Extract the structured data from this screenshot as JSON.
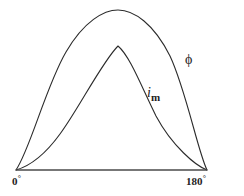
{
  "figure": {
    "background_color": "#ffffff",
    "line_color": "#2b2b2b",
    "baseline_color": "#4a4a4a"
  },
  "axis": {
    "start_label": "0",
    "end_label": "180",
    "degree_symbol": "°"
  },
  "annotations": {
    "flux_symbol": "ϕ",
    "current_symbol": "i",
    "current_subscript": "m"
  },
  "chart_data": {
    "type": "line",
    "title": "",
    "xlabel": "",
    "ylabel": "",
    "xlim": [
      0,
      180
    ],
    "ylim": [
      0,
      1
    ],
    "grid": false,
    "legend": "inline-annotations",
    "x_tick_labels": [
      "0°",
      "180°"
    ],
    "x_ticks": [
      0,
      180
    ],
    "x": [
      0,
      9,
      18,
      27,
      36,
      45,
      54,
      63,
      72,
      81,
      90,
      99,
      108,
      117,
      126,
      135,
      144,
      153,
      162,
      171,
      180
    ],
    "series": [
      {
        "name": "ϕ",
        "label": "ϕ",
        "description": "magnetic flux, smooth sinusoidal half-wave peaking near 95 degrees",
        "values": [
          0.0,
          0.155,
          0.305,
          0.445,
          0.575,
          0.69,
          0.79,
          0.875,
          0.94,
          0.985,
          1.0,
          0.985,
          0.94,
          0.875,
          0.79,
          0.69,
          0.575,
          0.445,
          0.305,
          0.155,
          0.0
        ],
        "peak_x": 95,
        "peak_y": 1.0
      },
      {
        "name": "i_m",
        "label": "iₘ",
        "description": "magnetizing current, peaked non-sinusoidal half-wave, concave start and steep flanks",
        "values": [
          0.0,
          0.035,
          0.08,
          0.135,
          0.205,
          0.29,
          0.39,
          0.5,
          0.615,
          0.715,
          0.775,
          0.705,
          0.605,
          0.495,
          0.39,
          0.295,
          0.215,
          0.145,
          0.085,
          0.035,
          0.0
        ],
        "peak_x": 92,
        "peak_y": 0.78
      }
    ],
    "svg_paths": {
      "flux_curve": "M 16,170 C 30,150 46,86 66,52 C 84,21 104,10 118,10 C 134,10 154,24 170,56 C 186,90 198,152 207,170",
      "current_curve": "M 16,170 C 30,166 44,156 60,134 C 78,110 102,62 118,46 C 130,56 142,88 156,116 C 172,146 196,166 207,170",
      "baseline": "M 16,170 L 207,170"
    }
  }
}
